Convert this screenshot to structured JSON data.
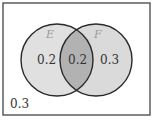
{
  "diagram": {
    "type": "venn",
    "sets": [
      {
        "name": "E",
        "only_value": "0.2"
      },
      {
        "name": "F",
        "only_value": "0.3"
      }
    ],
    "intersection_value": "0.2",
    "outside_value": "0.3",
    "colors": {
      "border": "#333333",
      "circle_fill": "#dedede",
      "intersection_fill": "#b4b4b4",
      "background": "#ffffff"
    }
  }
}
